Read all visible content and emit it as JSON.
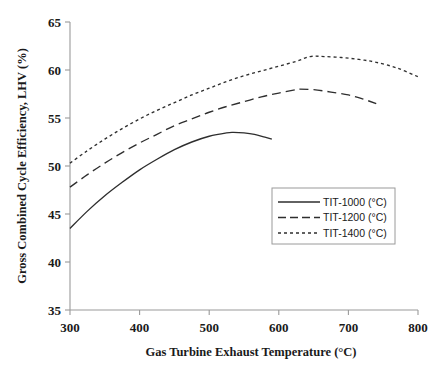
{
  "chart_data": {
    "type": "line",
    "title": "",
    "subtitle": "",
    "xlabel": "Gas Turbine Exhaust Temperature (°C)",
    "ylabel": "Gross Combined Cycle Efficiency, LHV (%)",
    "xlim": [
      300,
      800
    ],
    "ylim": [
      35,
      65
    ],
    "xticks": [
      300,
      400,
      500,
      600,
      700,
      800
    ],
    "yticks": [
      35,
      40,
      45,
      50,
      55,
      60,
      65
    ],
    "xtick_labels": [
      "300",
      "400",
      "500",
      "600",
      "700",
      "800"
    ],
    "ytick_labels": [
      "35",
      "40",
      "45",
      "50",
      "55",
      "60",
      "65"
    ],
    "grid": false,
    "legend_position": "center-right",
    "series": [
      {
        "name": "TIT-1000 (°C)",
        "style": "solid",
        "color": "#2e2e2e",
        "x": [
          300,
          325,
          350,
          375,
          400,
          425,
          450,
          475,
          500,
          525,
          535,
          550,
          565,
          580,
          590
        ],
        "y": [
          43.5,
          45.3,
          46.9,
          48.3,
          49.6,
          50.7,
          51.7,
          52.5,
          53.1,
          53.45,
          53.5,
          53.45,
          53.3,
          53.0,
          52.8
        ]
      },
      {
        "name": "TIT-1200 (°C)",
        "style": "long-dash",
        "color": "#2e2e2e",
        "x": [
          300,
          325,
          350,
          375,
          400,
          425,
          450,
          475,
          500,
          525,
          550,
          575,
          600,
          625,
          630,
          650,
          675,
          700,
          720,
          740
        ],
        "y": [
          47.8,
          49.1,
          50.3,
          51.4,
          52.4,
          53.3,
          54.2,
          54.9,
          55.6,
          56.2,
          56.7,
          57.2,
          57.6,
          57.95,
          58.0,
          57.95,
          57.7,
          57.4,
          57.0,
          56.5
        ]
      },
      {
        "name": "TIT-1400 (°C)",
        "style": "short-dash",
        "color": "#2e2e2e",
        "x": [
          300,
          325,
          350,
          375,
          400,
          425,
          450,
          475,
          500,
          525,
          550,
          575,
          600,
          625,
          645,
          665,
          690,
          715,
          740,
          770,
          800
        ],
        "y": [
          50.3,
          51.6,
          52.8,
          53.9,
          54.9,
          55.8,
          56.6,
          57.4,
          58.1,
          58.8,
          59.4,
          59.9,
          60.4,
          60.9,
          61.4,
          61.4,
          61.3,
          61.1,
          60.8,
          60.2,
          59.3
        ]
      }
    ],
    "legend": [
      {
        "label": "TIT-1000 (°C)",
        "style": "solid"
      },
      {
        "label": "TIT-1200 (°C)",
        "style": "long-dash"
      },
      {
        "label": "TIT-1400 (°C)",
        "style": "short-dash"
      }
    ]
  },
  "colors": {
    "background": "#ffffff",
    "axis": "#9a9a9a",
    "curve": "#2e2e2e",
    "text": "#1a1a1a",
    "legend_border": "#9a9a9a"
  }
}
